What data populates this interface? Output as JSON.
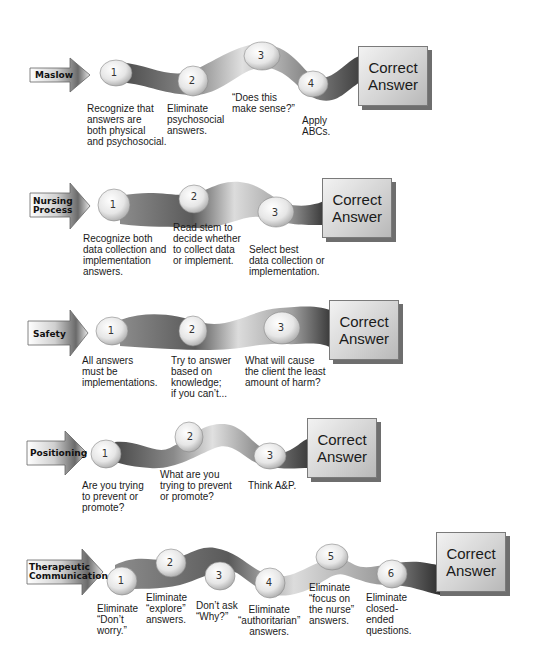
{
  "diagram": {
    "type": "flow-strategies",
    "end_label_lines": [
      "Correct",
      "Answer"
    ],
    "rows": [
      {
        "name": "Maslow",
        "label_lines": [
          "Maslow"
        ],
        "steps": [
          {
            "num": "1",
            "text": "Recognize that\nanswers are\nboth physical\nand psychosocial."
          },
          {
            "num": "2",
            "text": "Eliminate\npsychosocial\nanswers."
          },
          {
            "num": "3",
            "text": "“Does this\nmake sense?”"
          },
          {
            "num": "4",
            "text": "Apply\nABCs."
          }
        ]
      },
      {
        "name": "Nursing Process",
        "label_lines": [
          "Nursing",
          "Process"
        ],
        "steps": [
          {
            "num": "1",
            "text": "Recognize both\ndata collection and\nimplementation\nanswers."
          },
          {
            "num": "2",
            "text": "Read stem to\ndecide whether\nto collect data\nor implement."
          },
          {
            "num": "3",
            "text": "Select best\ndata collection or\nimplementation."
          }
        ]
      },
      {
        "name": "Safety",
        "label_lines": [
          "Safety"
        ],
        "steps": [
          {
            "num": "1",
            "text": "All answers\nmust be\nimplementations."
          },
          {
            "num": "2",
            "text": "Try to answer\nbased on\nknowledge;\nif you can’t..."
          },
          {
            "num": "3",
            "text": "What will cause\nthe client the least\namount of harm?"
          }
        ]
      },
      {
        "name": "Positioning",
        "label_lines": [
          "Positioning"
        ],
        "steps": [
          {
            "num": "1",
            "text": "Are you trying\nto prevent or\npromote?"
          },
          {
            "num": "2",
            "text": "What are you\ntrying to prevent\nor promote?"
          },
          {
            "num": "3",
            "text": "Think A&P."
          }
        ]
      },
      {
        "name": "Therapeutic Communication",
        "label_lines": [
          "Therapeutic",
          "Communication"
        ],
        "steps": [
          {
            "num": "1",
            "text": "Eliminate\n“Don’t\nworry.”"
          },
          {
            "num": "2",
            "text": "Eliminate\n“explore”\nanswers."
          },
          {
            "num": "3",
            "text": "Don’t ask\n“Why?”"
          },
          {
            "num": "4",
            "text": "Eliminate\n“authoritarian”\nanswers."
          },
          {
            "num": "5",
            "text": "Eliminate\n“focus on\nthe nurse”\nanswers."
          },
          {
            "num": "6",
            "text": "Eliminate\nclosed-\nended\nquestions."
          }
        ]
      }
    ]
  }
}
